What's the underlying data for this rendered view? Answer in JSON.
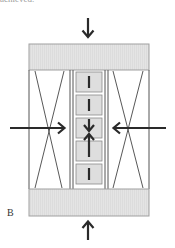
{
  "figure": {
    "partial_caption": "achieved.",
    "panel_label": "B",
    "colors": {
      "plate_fill": "#e3e3e3",
      "plate_stroke": "#9a9a9a",
      "frame_stroke": "#555555",
      "block_fill": "#dedede",
      "block_stroke": "#8a8a8a",
      "arrow": "#2a2a2a",
      "dash": "#2a2a2a"
    },
    "elements": {
      "top_plate": "compression-plate-top",
      "bottom_plate": "compression-plate-bottom",
      "left_chamber": "x-braced-chamber-left",
      "right_chamber": "x-braced-chamber-right",
      "center_column": "stacked-block-column",
      "block_count": 5
    },
    "arrows": [
      {
        "id": "top",
        "direction": "down"
      },
      {
        "id": "bottom",
        "direction": "up"
      },
      {
        "id": "left",
        "direction": "right"
      },
      {
        "id": "right",
        "direction": "left"
      },
      {
        "id": "center-upper",
        "direction": "down"
      },
      {
        "id": "center-lower",
        "direction": "up"
      }
    ]
  }
}
